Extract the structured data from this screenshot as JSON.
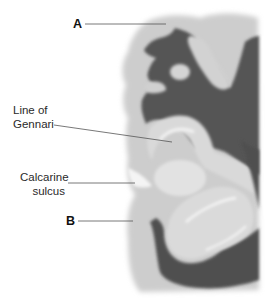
{
  "figure": {
    "colors": {
      "background": "#ffffff",
      "gray_matter": "#c9c9c9",
      "gray_matter_light": "#dedede",
      "white_matter": "#5a5a5a",
      "white_matter_dark": "#4a4a4a",
      "gennari_stripe": "#f2f2f2"
    },
    "labels": [
      {
        "id": "A",
        "text": "A"
      },
      {
        "id": "gennari",
        "line1": "Line of",
        "line2": "Gennari"
      },
      {
        "id": "calcarine",
        "line1": "Calcarine",
        "line2": "sulcus"
      },
      {
        "id": "B",
        "text": "B"
      }
    ]
  }
}
